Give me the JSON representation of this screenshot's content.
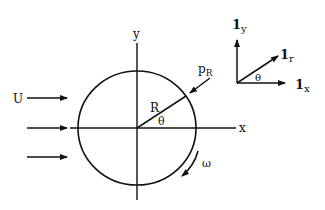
{
  "diagram": {
    "labels": {
      "free_stream": "U",
      "x_axis": "x",
      "y_axis": "y",
      "radius": "R",
      "angle": "θ",
      "pressure_main": "p",
      "pressure_sub": "R",
      "rotation": "ω",
      "unit_y_main": "1",
      "unit_y_sub": "y",
      "unit_r_main": "1",
      "unit_r_sub": "r",
      "unit_x_main": "1",
      "unit_x_sub": "x",
      "unit_angle": "θ"
    },
    "colors": {
      "stroke": "#111111",
      "background": "#ffffff"
    }
  }
}
